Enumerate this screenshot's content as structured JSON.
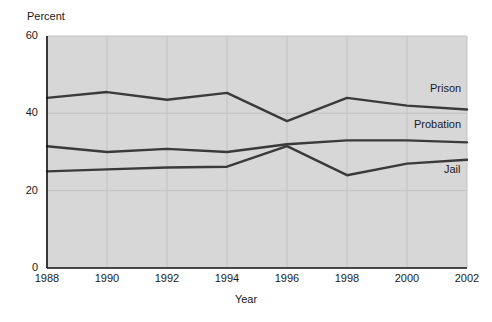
{
  "chart_data": {
    "type": "line",
    "title": "",
    "xlabel": "Year",
    "ylabel": "Percent",
    "ylabel_position": "top-left",
    "x": [
      1988,
      1990,
      1992,
      1994,
      1996,
      1998,
      2000,
      2002
    ],
    "xtick_labels": [
      "1988",
      "1990",
      "1992",
      "1994",
      "1996",
      "1998",
      "2000",
      "2002"
    ],
    "ytick_labels": [
      "0",
      "20",
      "40",
      "60"
    ],
    "yticks": [
      0,
      20,
      40,
      60
    ],
    "xlim": [
      1988,
      2002
    ],
    "ylim": [
      0,
      60
    ],
    "grid": true,
    "grid_style": "light vertical and horizontal gridlines on gray panel",
    "legend": "inline end-of-line labels",
    "plot_background": "#d7d7d7",
    "line_color": "#3a3a3a",
    "series": [
      {
        "name": "Prison",
        "label": "Prison",
        "values": [
          44.0,
          45.5,
          43.5,
          45.3,
          38.0,
          44.0,
          42.0,
          41.0
        ]
      },
      {
        "name": "Probation",
        "label": "Probation",
        "values": [
          31.5,
          30.0,
          30.8,
          30.0,
          32.0,
          33.0,
          33.0,
          32.5
        ]
      },
      {
        "name": "Jail",
        "label": "Jail",
        "values": [
          25.0,
          25.5,
          26.0,
          26.2,
          31.5,
          24.0,
          27.0,
          28.0
        ]
      }
    ]
  }
}
